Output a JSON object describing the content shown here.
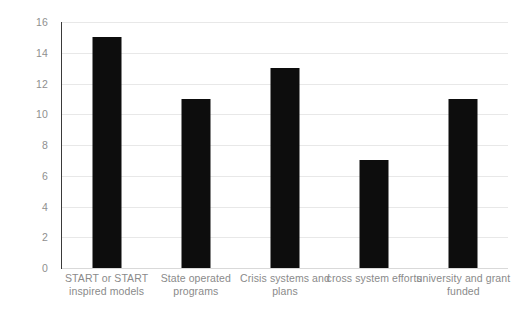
{
  "chart_data": {
    "type": "bar",
    "title": "",
    "xlabel": "",
    "ylabel": "",
    "categories": [
      "START or START inspired models",
      "State operated programs",
      "Crisis systems and plans",
      "cross  system efforts",
      "university and grant funded"
    ],
    "values": [
      15,
      11,
      13,
      7,
      11
    ],
    "ylim": [
      0,
      16
    ],
    "ytick_labels": [
      "16",
      "14",
      "12",
      "10",
      "8",
      "6",
      "4",
      "2",
      "0"
    ],
    "ytick_values": [
      16,
      14,
      12,
      10,
      8,
      6,
      4,
      2,
      0
    ],
    "ytick_step": 2,
    "grid": true,
    "legend": false,
    "bar_color": "#0d0d0d",
    "gridline_color": "#e8e8e8",
    "axis_color": "#3a3a3a",
    "tick_label_color": "#8f8f8f",
    "category_label_color": "#8a8a8a",
    "background_color": "#ffffff"
  }
}
